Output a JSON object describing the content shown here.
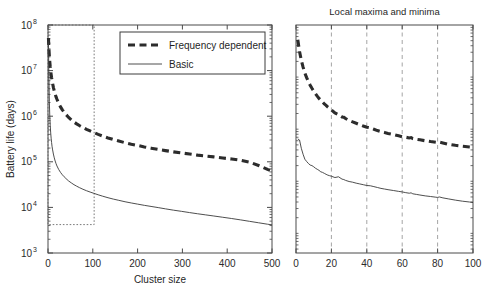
{
  "figure": {
    "width": 492,
    "height": 290,
    "background": "#ffffff"
  },
  "chart_data": [
    {
      "id": "left-panel",
      "type": "line",
      "title": "",
      "xlabel": "Cluster size",
      "ylabel": "Battery life (days)",
      "xscale": "linear",
      "yscale": "log",
      "xlim": [
        0,
        500
      ],
      "ylim": [
        1000,
        100000000
      ],
      "grid": false,
      "xticks": [
        0,
        100,
        200,
        300,
        400,
        500
      ],
      "xticklabels": [
        "0",
        "100",
        "200",
        "300",
        "400",
        "500"
      ],
      "yticks": [
        1000,
        10000,
        100000,
        1000000,
        10000000,
        100000000
      ],
      "yticklabels": [
        "10^3",
        "10^4",
        "10^5",
        "10^6",
        "10^7",
        "10^8"
      ],
      "ytick_mantissa": "10",
      "ytick_exponents": [
        "3",
        "4",
        "5",
        "6",
        "7",
        "8"
      ],
      "legend": {
        "position": "upper-center-right",
        "entries": [
          {
            "label": "Frequency dependent",
            "style": "thick-dashed",
            "color": "#2c2c2c"
          },
          {
            "label": "Basic",
            "style": "thin-solid",
            "color": "#3a3a3a"
          }
        ]
      },
      "annotations": [
        {
          "name": "inset-region-box",
          "type": "dotted-rectangle",
          "x_range": [
            0,
            103
          ],
          "y_range": [
            4200,
            100000000
          ],
          "color": "#6b6b6b"
        }
      ],
      "series": [
        {
          "name": "Frequency dependent",
          "style": "thick-dashed",
          "color": "#2c2c2c",
          "x": [
            1,
            2,
            3,
            4,
            5,
            6,
            7,
            8,
            9,
            10,
            12,
            14,
            16,
            18,
            20,
            24,
            28,
            32,
            36,
            40,
            46,
            52,
            58,
            64,
            70,
            78,
            86,
            94,
            102,
            112,
            122,
            134,
            146,
            158,
            172,
            186,
            200,
            215,
            230,
            246,
            262,
            280,
            298,
            316,
            334,
            352,
            370,
            390,
            410,
            430,
            450,
            470,
            490,
            500
          ],
          "y": [
            52000000,
            31000000,
            21000000,
            15500000,
            12000000,
            9800000,
            8200000,
            7000000,
            6100000,
            5400000,
            4300000,
            3600000,
            3050000,
            2650000,
            2350000,
            1900000,
            1600000,
            1380000,
            1220000,
            1090000,
            940000,
            830000,
            745000,
            680000,
            625000,
            565000,
            515000,
            475000,
            440000,
            400000,
            367000,
            334000,
            307000,
            285000,
            262000,
            243000,
            228000,
            212000,
            199000,
            187000,
            176000,
            165000,
            156000,
            148000,
            140000,
            134000,
            128000,
            121000,
            115000,
            108000,
            98000,
            83000,
            68000,
            62000
          ]
        },
        {
          "name": "Basic",
          "style": "thin-solid",
          "color": "#3a3a3a",
          "x": [
            1,
            2,
            3,
            4,
            5,
            6,
            7,
            8,
            9,
            10,
            12,
            14,
            16,
            18,
            20,
            24,
            28,
            32,
            36,
            40,
            46,
            52,
            58,
            64,
            70,
            78,
            86,
            94,
            102,
            112,
            122,
            134,
            146,
            158,
            172,
            186,
            200,
            215,
            230,
            246,
            262,
            280,
            298,
            316,
            334,
            352,
            370,
            390,
            410,
            430,
            450,
            470,
            490,
            500
          ],
          "y": [
            44000000,
            7800000,
            2100000,
            1000000,
            620000,
            430000,
            330000,
            265000,
            220000,
            190000,
            148000,
            122000,
            104000,
            91000,
            81000,
            67500,
            58500,
            52000,
            47000,
            43000,
            38000,
            34500,
            31500,
            29200,
            27200,
            25000,
            23200,
            21700,
            20400,
            18900,
            17600,
            16300,
            15200,
            14300,
            13300,
            12500,
            11800,
            11100,
            10500,
            9900,
            9300,
            8700,
            8200,
            7700,
            7250,
            6850,
            6480,
            6080,
            5700,
            5320,
            4950,
            4600,
            4280,
            4150
          ]
        }
      ]
    },
    {
      "id": "right-panel",
      "type": "line",
      "title": "Local maxima and minima",
      "xlabel": "",
      "ylabel": "",
      "xscale": "linear",
      "yscale": "log",
      "xlim": [
        0,
        100
      ],
      "ylim": [
        4200,
        100000000
      ],
      "grid": true,
      "gridlines_x": [
        20,
        40,
        60,
        80
      ],
      "xticks": [
        0,
        20,
        40,
        60,
        80,
        100
      ],
      "xticklabels": [
        "0",
        "20",
        "40",
        "60",
        "80",
        "100"
      ],
      "yticks": [],
      "yticklabels": [],
      "series": [
        {
          "name": "Frequency dependent",
          "style": "thick-dashed",
          "color": "#2c2c2c",
          "x": [
            1,
            2,
            3,
            4,
            5,
            6,
            7,
            8,
            9,
            10,
            11,
            12,
            13,
            14,
            15,
            16,
            17,
            18,
            19,
            20,
            22,
            24,
            26,
            27,
            28,
            30,
            32,
            34,
            36,
            38,
            40,
            42,
            44,
            46,
            48,
            50,
            52,
            55,
            58,
            60,
            62,
            64,
            65,
            66,
            68,
            70,
            73,
            76,
            79,
            80,
            81,
            83,
            86,
            90,
            94,
            98,
            100
          ],
          "y": [
            52000000,
            31000000,
            21000000,
            15500000,
            12000000,
            9800000,
            8200000,
            7000000,
            6100000,
            5400000,
            4800000,
            4300000,
            3900000,
            3600000,
            3320000,
            3050000,
            2870000,
            2650000,
            2500000,
            2350000,
            2050000,
            1900000,
            1720000,
            1700000,
            1600000,
            1470000,
            1380000,
            1300000,
            1220000,
            1150000,
            1090000,
            1060000,
            1000000,
            940000,
            900000,
            865000,
            830000,
            790000,
            745000,
            718000,
            700000,
            680000,
            690000,
            660000,
            640000,
            625000,
            600000,
            578000,
            560000,
            555000,
            565000,
            545000,
            515000,
            490000,
            470000,
            455000,
            448000
          ]
        },
        {
          "name": "Basic",
          "style": "thin-solid",
          "color": "#3a3a3a",
          "x": [
            1,
            2,
            3,
            4,
            5,
            6,
            7,
            8,
            9,
            10,
            11,
            12,
            13,
            14,
            15,
            16,
            17,
            18,
            19,
            20,
            22,
            24,
            26,
            27,
            28,
            30,
            32,
            34,
            36,
            38,
            40,
            42,
            44,
            46,
            48,
            50,
            52,
            55,
            58,
            60,
            62,
            64,
            65,
            66,
            68,
            70,
            73,
            76,
            79,
            80,
            81,
            83,
            86,
            90,
            94,
            98,
            100
          ],
          "y": [
            650000,
            620000,
            430000,
            330000,
            265000,
            240000,
            220000,
            205000,
            200000,
            190000,
            178000,
            170000,
            162000,
            152000,
            148000,
            142000,
            136000,
            131000,
            128000,
            125000,
            118000,
            122000,
            110000,
            108000,
            104000,
            99000,
            96000,
            92000,
            89000,
            86000,
            83000,
            82000,
            79000,
            76000,
            73000,
            71000,
            69000,
            66500,
            64000,
            62500,
            60500,
            59000,
            60000,
            57500,
            56000,
            54500,
            52500,
            51000,
            49500,
            49000,
            50000,
            48000,
            46000,
            43500,
            41500,
            40000,
            39000
          ]
        }
      ]
    }
  ]
}
